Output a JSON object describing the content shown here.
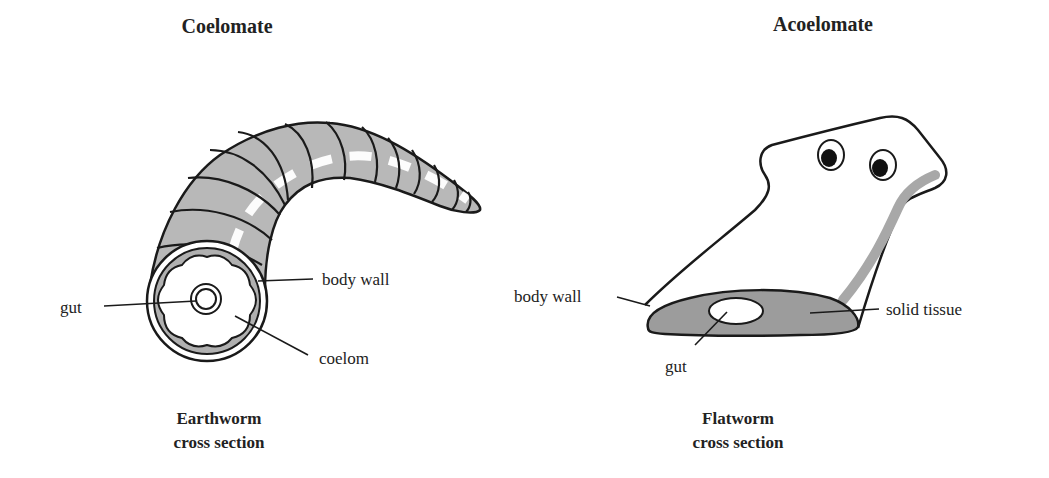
{
  "panels": [
    {
      "title": "Coelomate",
      "caption_line1": "Earthworm",
      "caption_line2": "cross section",
      "labels": {
        "gut": "gut",
        "body_wall": "body wall",
        "coelom": "coelom"
      }
    },
    {
      "title": "Acoelomate",
      "caption_line1": "Flatworm",
      "caption_line2": "cross section",
      "labels": {
        "body_wall": "body wall",
        "gut": "gut",
        "solid_tissue": "solid tissue"
      }
    }
  ],
  "colors": {
    "fill_gray": "#b5b5b5",
    "dark_gray": "#9a9a9a",
    "stroke": "#1a1a1a"
  }
}
